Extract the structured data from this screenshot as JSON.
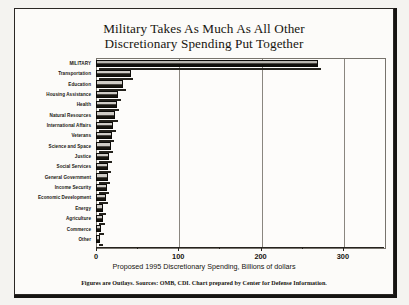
{
  "chart_data": {
    "type": "bar",
    "orientation": "horizontal",
    "title": "Military Takes As Much As All Other Discretionary Spending Put Together",
    "title_lines": [
      "Military Takes As Much As All Other",
      "Discretionary Spending Put Together"
    ],
    "xlabel": "Proposed 1995 Discretionary Spending, Billions of dollars",
    "ylabel": "",
    "xlim": [
      0,
      350
    ],
    "xticks": [
      0,
      100,
      200,
      300
    ],
    "xtick_labels": [
      "0",
      "100",
      "200",
      "300"
    ],
    "grid": true,
    "legend": null,
    "categories": [
      "MILITARY",
      "Transportation",
      "Education",
      "Housing Assistance",
      "Health",
      "Natural Resources",
      "International Affairs",
      "Veterans",
      "Science and Space",
      "Justice",
      "Social Services",
      "General Government",
      "Income Security",
      "Economic Development",
      "Energy",
      "Agriculture",
      "Commerce",
      "Other"
    ],
    "values": [
      270,
      42,
      33,
      27,
      25,
      23,
      21,
      19,
      18,
      16,
      15,
      14,
      13,
      12,
      9,
      8,
      6,
      5
    ],
    "units": "Billions of dollars",
    "footnote": "Figures are Outlays. Sources: OMB, CDI. Chart prepared by Center for Defense Information."
  },
  "colors": {
    "bar_fill": "#17150f",
    "bar_highlight": "#cfccc6",
    "frame": "#77736c",
    "text": "#17150f",
    "page_background": "#fcfbf9"
  }
}
